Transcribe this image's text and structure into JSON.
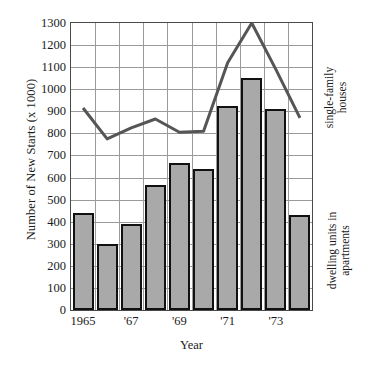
{
  "chart_data": {
    "type": "bar",
    "title": "",
    "xlabel": "Year",
    "ylabel": "Number of New Starts (x 1000)",
    "ylim": [
      0,
      1300
    ],
    "ytick_step": 100,
    "yticks": [
      0,
      100,
      200,
      300,
      400,
      500,
      600,
      700,
      800,
      900,
      1000,
      1100,
      1200,
      1300
    ],
    "ytick_labels": [
      "0",
      "100",
      "200",
      "300",
      "400",
      "500",
      "600",
      "700",
      "800",
      "900",
      "1000",
      "1100",
      "1200",
      "1300"
    ],
    "grid": true,
    "legend_position": "right-axis-annotations",
    "categories": [
      "1965",
      "1966",
      "1967",
      "1968",
      "1969",
      "1970",
      "1971",
      "1972",
      "1973",
      "1974"
    ],
    "xtick_labels": [
      {
        "label": "1965",
        "index": 0
      },
      {
        "label": "'67",
        "index": 2
      },
      {
        "label": "'69",
        "index": 4
      },
      {
        "label": "'71",
        "index": 6
      },
      {
        "label": "'73",
        "index": 8
      }
    ],
    "series": [
      {
        "name": "dwelling units in apartments",
        "type": "bar",
        "color": "#a9a9a9",
        "edge_color": "#111111",
        "values": [
          440,
          300,
          390,
          565,
          665,
          640,
          925,
          1050,
          910,
          430
        ]
      },
      {
        "name": "single-family houses",
        "type": "line",
        "color": "#555555",
        "values": [
          915,
          775,
          825,
          865,
          805,
          810,
          1120,
          1300,
          1090,
          870
        ]
      }
    ],
    "annotations": {
      "line_series_label_line1": "single-family",
      "line_series_label_line2": "houses",
      "bar_series_label_line1": "dwelling units in",
      "bar_series_label_line2": "apartments"
    }
  }
}
